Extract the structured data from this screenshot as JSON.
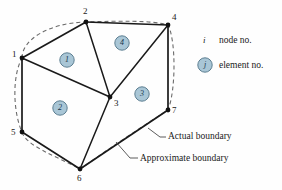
{
  "figure": {
    "colors": {
      "edge": "#1a1a1a",
      "dashed_boundary": "#6b6b6b",
      "element_circle_fill": "#a9c6d6",
      "element_circle_stroke": "#5d7f92",
      "element_text": "#17344a",
      "background": "#fefefe",
      "label_text": "#1a1a1a"
    },
    "nodes": [
      {
        "id": "1",
        "label": "1",
        "x": 22,
        "y": 58,
        "label_x": 12,
        "label_y": 52
      },
      {
        "id": "2",
        "label": "2",
        "x": 86,
        "y": 22,
        "label_x": 83,
        "label_y": 8
      },
      {
        "id": "3",
        "label": "3",
        "x": 110,
        "y": 97,
        "label_x": 114,
        "label_y": 100
      },
      {
        "id": "4",
        "label": "4",
        "x": 168,
        "y": 25,
        "label_x": 172,
        "label_y": 14
      },
      {
        "id": "5",
        "label": "5",
        "x": 22,
        "y": 132,
        "label_x": 11,
        "label_y": 130
      },
      {
        "id": "6",
        "label": "6",
        "x": 80,
        "y": 169,
        "label_x": 77,
        "label_y": 174
      },
      {
        "id": "7",
        "label": "7",
        "x": 168,
        "y": 110,
        "label_x": 172,
        "label_y": 108
      }
    ],
    "mesh_edges": [
      {
        "from": "1",
        "to": "2"
      },
      {
        "from": "2",
        "to": "4"
      },
      {
        "from": "4",
        "to": "7"
      },
      {
        "from": "7",
        "to": "6"
      },
      {
        "from": "6",
        "to": "5"
      },
      {
        "from": "5",
        "to": "1"
      },
      {
        "from": "1",
        "to": "3"
      },
      {
        "from": "2",
        "to": "3"
      },
      {
        "from": "3",
        "to": "4"
      },
      {
        "from": "3",
        "to": "6"
      }
    ],
    "elements": [
      {
        "id": "1",
        "label": "1",
        "cx": 67,
        "cy": 60
      },
      {
        "id": "2",
        "label": "2",
        "cx": 60,
        "cy": 108
      },
      {
        "id": "3",
        "label": "3",
        "cx": 142,
        "cy": 94
      },
      {
        "id": "4",
        "label": "4",
        "cx": 122,
        "cy": 43
      }
    ],
    "annotations": [
      {
        "id": "actual-boundary",
        "label": "Actual boundary",
        "x": 168,
        "y": 136
      },
      {
        "id": "approximate-boundary",
        "label": "Approximate boundary",
        "x": 140,
        "y": 160
      }
    ],
    "legend": {
      "node_symbol": "i",
      "node_text": "node no.",
      "element_symbol": "j",
      "element_text": "element no."
    }
  }
}
